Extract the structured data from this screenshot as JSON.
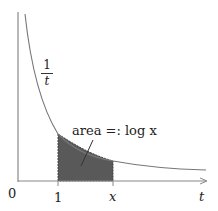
{
  "diagram": {
    "curve_label": {
      "numerator": "1",
      "denominator": "t"
    },
    "area_label": "area =: log x",
    "origin_label": "0",
    "tick_labels": {
      "one": "1",
      "x": "x"
    },
    "axis_label": "t",
    "colors": {
      "axis": "#888888",
      "curve": "#777777",
      "shade": "#555555"
    }
  }
}
